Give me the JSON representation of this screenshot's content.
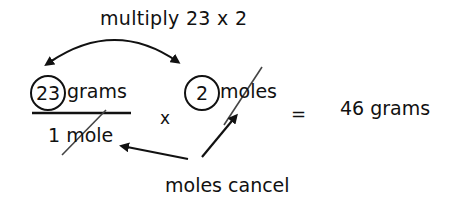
{
  "diagram": {
    "title": "multiply 23 x 2",
    "numerator": {
      "circled_value": "23",
      "unit": "grams"
    },
    "denominator": {
      "text": "1 mole",
      "cancelled": true
    },
    "operator": "x",
    "second_factor": {
      "circled_value": "2",
      "unit": "moles",
      "cancelled": true
    },
    "equals": "=",
    "result": "46 grams",
    "annotation": "moles cancel",
    "arrows": [
      {
        "name": "multiply-arc",
        "from": "23",
        "to": "2",
        "bidirectional": true
      },
      {
        "name": "cancel-arrow-left",
        "from": "moles cancel",
        "to": "1 mole"
      },
      {
        "name": "cancel-arrow-right",
        "from": "moles cancel",
        "to": "moles"
      }
    ],
    "colors": {
      "ink": "#111111",
      "strike": "#444444",
      "background": "#ffffff"
    }
  }
}
